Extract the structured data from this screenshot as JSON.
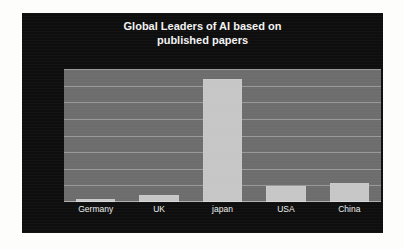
{
  "chart_data": {
    "type": "bar",
    "title": "Global Leaders of AI based on published papers",
    "title_lines": [
      "Global Leaders of AI based on",
      "published papers"
    ],
    "categories": [
      "Germany",
      "UK",
      "japan",
      "USA",
      "China"
    ],
    "values": [
      4000,
      9000,
      148000,
      19000,
      23000
    ],
    "xlabel": "",
    "ylabel": "",
    "ylim": [
      0,
      160000
    ],
    "ytick_step": 20000,
    "yticks": [
      160000,
      140000,
      120000,
      100000,
      80000,
      60000,
      40000,
      20000,
      0
    ],
    "ytick_labels": [
      "160000",
      "140000",
      "120000",
      "100000",
      "80000",
      "60000",
      "40000",
      "20000",
      "0"
    ],
    "grid": true,
    "legend": false,
    "legend_position": "none",
    "colors": {
      "panel_background": "#0e0e0e",
      "plot_background": "#6d6d6d",
      "bar": "#c6c6c6",
      "gridline": "#d7d7d7",
      "title_text": "#f2f2f2",
      "axis_text": "#f0f0f0",
      "page_background": "#fdfdfb"
    }
  },
  "artifacts": {
    "top_bleed": "",
    "mid_bleed": "",
    "bottom_bleed": ""
  }
}
